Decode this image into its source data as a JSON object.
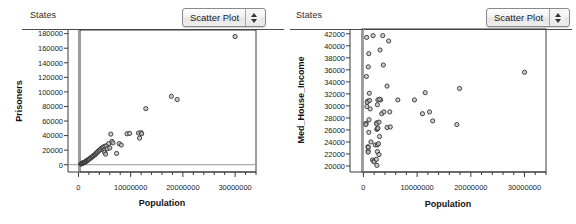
{
  "panels": [
    {
      "title": "States",
      "control": {
        "label": "Scatter Plot",
        "up_icon": "spinner-up-icon",
        "down_icon": "spinner-down-icon"
      },
      "chart_data": {
        "type": "scatter",
        "title": "States",
        "xlabel": "Population",
        "ylabel": "Prisoners",
        "xlim": [
          -2000000,
          34000000
        ],
        "ylim": [
          -10000,
          185000
        ],
        "xticks": [
          0,
          10000000,
          20000000,
          30000000
        ],
        "xticklabels": [
          "0",
          "10000000",
          "20000000",
          "30000000"
        ],
        "yticks": [
          0,
          20000,
          40000,
          60000,
          80000,
          100000,
          120000,
          140000,
          160000,
          180000
        ],
        "yticklabels": [
          "0",
          "20000",
          "40000",
          "60000",
          "80000",
          "100000",
          "120000",
          "140000",
          "160000",
          "180000"
        ],
        "grid": false,
        "legend": null,
        "marker": "open-circle",
        "points": [
          [
            455000,
            1000
          ],
          [
            550000,
            1200
          ],
          [
            600000,
            1500
          ],
          [
            640000,
            1800
          ],
          [
            720000,
            2000
          ],
          [
            800000,
            2200
          ],
          [
            900000,
            2500
          ],
          [
            1000000,
            2800
          ],
          [
            1100000,
            3000
          ],
          [
            1200000,
            3400
          ],
          [
            1250000,
            3600
          ],
          [
            1350000,
            4200
          ],
          [
            1450000,
            4500
          ],
          [
            1500000,
            5000
          ],
          [
            1600000,
            5400
          ],
          [
            1700000,
            6000
          ],
          [
            1800000,
            6500
          ],
          [
            1900000,
            7000
          ],
          [
            2000000,
            7400
          ],
          [
            2100000,
            8000
          ],
          [
            2300000,
            9000
          ],
          [
            2400000,
            9500
          ],
          [
            2550000,
            10500
          ],
          [
            2700000,
            11000
          ],
          [
            2800000,
            12000
          ],
          [
            2900000,
            12500
          ],
          [
            3100000,
            13500
          ],
          [
            3200000,
            14000
          ],
          [
            3300000,
            15000
          ],
          [
            3450000,
            16000
          ],
          [
            3600000,
            17000
          ],
          [
            3700000,
            18000
          ],
          [
            3900000,
            19000
          ],
          [
            4000000,
            20000
          ],
          [
            4200000,
            21000
          ],
          [
            4400000,
            22500
          ],
          [
            4600000,
            23500
          ],
          [
            4800000,
            24500
          ],
          [
            4900000,
            19500
          ],
          [
            5000000,
            17000
          ],
          [
            5100000,
            25500
          ],
          [
            5200000,
            14500
          ],
          [
            5400000,
            26000
          ],
          [
            5550000,
            22000
          ],
          [
            5800000,
            29000
          ],
          [
            6000000,
            23000
          ],
          [
            6200000,
            42000
          ],
          [
            6400000,
            32000
          ],
          [
            6600000,
            30000
          ],
          [
            7300000,
            15500
          ],
          [
            7800000,
            29000
          ],
          [
            8200000,
            27000
          ],
          [
            9300000,
            42500
          ],
          [
            9800000,
            43000
          ],
          [
            11500000,
            43500
          ],
          [
            11700000,
            36500
          ],
          [
            12000000,
            44000
          ],
          [
            12100000,
            42500
          ],
          [
            12900000,
            77000
          ],
          [
            17800000,
            94000
          ],
          [
            18900000,
            89500
          ],
          [
            30000000,
            176000
          ]
        ]
      }
    },
    {
      "title": "States",
      "control": {
        "label": "Scatter Plot",
        "up_icon": "spinner-up-icon",
        "down_icon": "spinner-down-icon"
      },
      "chart_data": {
        "type": "scatter",
        "title": "States",
        "xlabel": "Population",
        "ylabel": "Med_House_Income",
        "xlim": [
          -2500000,
          34000000
        ],
        "ylim": [
          19000,
          42800
        ],
        "xticks": [
          0,
          10000000,
          20000000,
          30000000
        ],
        "xticklabels": [
          "0",
          "10000000",
          "20000000",
          "30000000"
        ],
        "yticks": [
          20000,
          22000,
          24000,
          26000,
          28000,
          30000,
          32000,
          34000,
          36000,
          38000,
          40000,
          42000
        ],
        "yticklabels": [
          "20000",
          "22000",
          "24000",
          "26000",
          "28000",
          "30000",
          "32000",
          "34000",
          "36000",
          "38000",
          "40000",
          "42000"
        ],
        "grid": false,
        "legend": null,
        "marker": "open-circle",
        "points": [
          [
            600000,
            41400
          ],
          [
            1800000,
            41700
          ],
          [
            3600000,
            41700
          ],
          [
            4700000,
            40800
          ],
          [
            1000000,
            38700
          ],
          [
            3100000,
            39300
          ],
          [
            900000,
            36500
          ],
          [
            3700000,
            36800
          ],
          [
            550000,
            34900
          ],
          [
            30000000,
            35600
          ],
          [
            1100000,
            32100
          ],
          [
            4400000,
            33300
          ],
          [
            3200000,
            31000
          ],
          [
            800000,
            30800
          ],
          [
            700000,
            30600
          ],
          [
            1150000,
            30900
          ],
          [
            2700000,
            31000
          ],
          [
            3000000,
            31100
          ],
          [
            6400000,
            31000
          ],
          [
            9500000,
            31000
          ],
          [
            650000,
            29900
          ],
          [
            1250000,
            29500
          ],
          [
            2600000,
            30200
          ],
          [
            11500000,
            32200
          ],
          [
            17900000,
            32900
          ],
          [
            500000,
            27100
          ],
          [
            1050000,
            27700
          ],
          [
            2500000,
            27200
          ],
          [
            2450000,
            27000
          ],
          [
            2900000,
            27300
          ],
          [
            3400000,
            28700
          ],
          [
            3800000,
            29000
          ],
          [
            4900000,
            29000
          ],
          [
            11000000,
            28700
          ],
          [
            12300000,
            29000
          ],
          [
            12900000,
            27500
          ],
          [
            17400000,
            26900
          ],
          [
            450000,
            26900
          ],
          [
            1000000,
            25600
          ],
          [
            2500000,
            26100
          ],
          [
            2600000,
            26200
          ],
          [
            2700000,
            26300
          ],
          [
            4400000,
            26400
          ],
          [
            5000000,
            26500
          ],
          [
            850000,
            23200
          ],
          [
            900000,
            23100
          ],
          [
            880000,
            22500
          ],
          [
            870000,
            22300
          ],
          [
            1400000,
            24000
          ],
          [
            2200000,
            23500
          ],
          [
            2600000,
            23500
          ],
          [
            2800000,
            23700
          ],
          [
            3000000,
            24900
          ],
          [
            1700000,
            21000
          ],
          [
            1950000,
            20800
          ],
          [
            2000000,
            20700
          ],
          [
            2400000,
            21100
          ],
          [
            2600000,
            22400
          ],
          [
            2900000,
            21900
          ],
          [
            2500000,
            20100
          ]
        ]
      }
    }
  ]
}
